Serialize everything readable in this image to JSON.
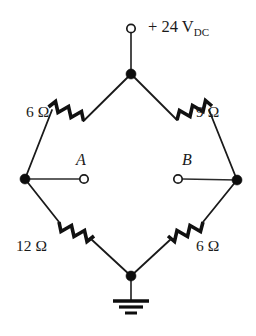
{
  "diagram": {
    "source": {
      "label_prefix": "+ 24 V",
      "label_subscript": "DC",
      "terminal_icon": "open-terminal-circle"
    },
    "resistors": [
      {
        "id": "top-left",
        "value": "6 Ω",
        "position": "upper-left-branch"
      },
      {
        "id": "top-right",
        "value": "9 Ω",
        "position": "upper-right-branch"
      },
      {
        "id": "bottom-left",
        "value": "12 Ω",
        "position": "lower-left-branch"
      },
      {
        "id": "bottom-right",
        "value": "6 Ω",
        "position": "lower-right-branch"
      }
    ],
    "terminals": [
      {
        "id": "a",
        "label": "A",
        "side": "left",
        "icon": "open-terminal-circle"
      },
      {
        "id": "b",
        "label": "B",
        "side": "right",
        "icon": "open-terminal-circle"
      }
    ],
    "ground": {
      "icon": "earth-ground-icon"
    },
    "nodes": [
      {
        "id": "top",
        "x": 131,
        "y": 74
      },
      {
        "id": "left",
        "x": 25,
        "y": 179
      },
      {
        "id": "right",
        "x": 237,
        "y": 180
      },
      {
        "id": "bottom",
        "x": 131,
        "y": 276
      }
    ],
    "colors": {
      "wire": "#1a1a1a",
      "background": "#ffffff",
      "node_fill": "#0d0d0d"
    }
  }
}
